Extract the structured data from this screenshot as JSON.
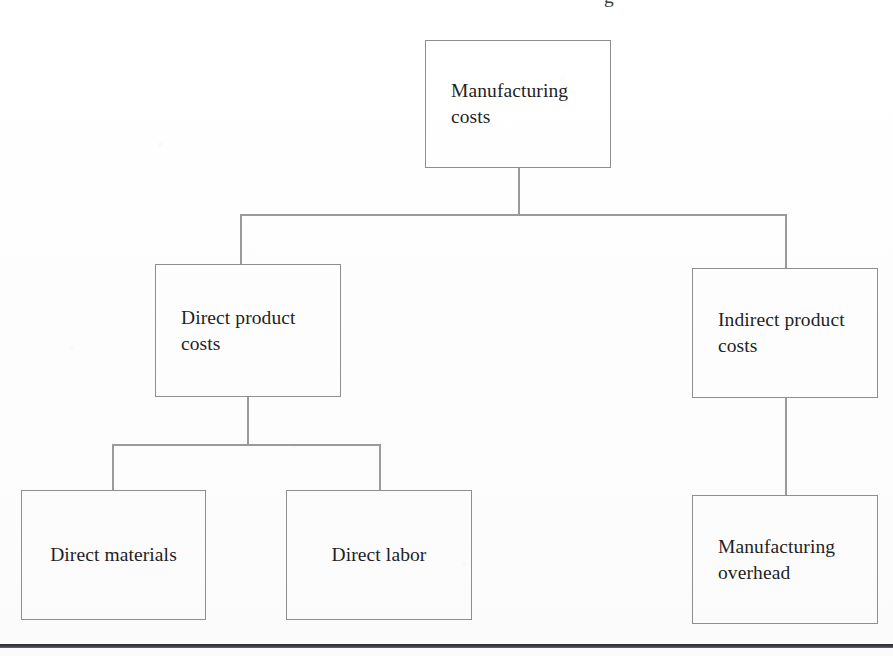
{
  "page": {
    "width": 893,
    "height": 656,
    "background": "#fefefe",
    "ink_color": "#1f1f1f",
    "box_border_color": "#8e8e8e",
    "connector_color": "#9a9a9a",
    "rule_color": "#2e2e33"
  },
  "clipped_header": {
    "text": "g"
  },
  "chart_data": {
    "type": "diagram",
    "subtype": "tree-hierarchy",
    "title": "",
    "orientation": "top-down",
    "levels": 3,
    "nodes": [
      {
        "id": "manufacturing-costs",
        "label": "Manufacturing\ncosts",
        "level": 0,
        "align": "left",
        "x": 425,
        "y": 40,
        "width": 186,
        "height": 128
      },
      {
        "id": "direct-product-costs",
        "label": "Direct product\ncosts",
        "level": 1,
        "align": "left",
        "x": 155,
        "y": 264,
        "width": 186,
        "height": 133
      },
      {
        "id": "indirect-product-costs",
        "label": "Indirect product\ncosts",
        "level": 1,
        "align": "left",
        "x": 692,
        "y": 268,
        "width": 186,
        "height": 130
      },
      {
        "id": "direct-materials",
        "label": "Direct materials",
        "level": 2,
        "align": "center",
        "x": 21,
        "y": 490,
        "width": 185,
        "height": 130
      },
      {
        "id": "direct-labor",
        "label": "Direct labor",
        "level": 2,
        "align": "center",
        "x": 286,
        "y": 490,
        "width": 186,
        "height": 130
      },
      {
        "id": "manufacturing-overhead",
        "label": "Manufacturing\noverhead",
        "level": 2,
        "align": "left",
        "x": 692,
        "y": 495,
        "width": 186,
        "height": 129
      }
    ],
    "edges": [
      {
        "from": "manufacturing-costs",
        "to": "direct-product-costs"
      },
      {
        "from": "manufacturing-costs",
        "to": "indirect-product-costs"
      },
      {
        "from": "direct-product-costs",
        "to": "direct-materials"
      },
      {
        "from": "direct-product-costs",
        "to": "direct-labor"
      },
      {
        "from": "indirect-product-costs",
        "to": "manufacturing-overhead"
      }
    ]
  },
  "connectors": {
    "level0_stem": {
      "x": 518,
      "y": 168,
      "height": 47
    },
    "level0_bar": {
      "x": 240,
      "y": 214,
      "width": 546
    },
    "level0_left_drop": {
      "x": 240,
      "y": 214,
      "height": 50
    },
    "level0_right_drop": {
      "x": 785,
      "y": 214,
      "height": 54
    },
    "level1_stem": {
      "x": 247,
      "y": 397,
      "height": 47
    },
    "level1_bar": {
      "x": 112,
      "y": 444,
      "width": 267
    },
    "level1_left_drop": {
      "x": 112,
      "y": 444,
      "height": 47
    },
    "level1_right_drop": {
      "x": 379,
      "y": 444,
      "height": 47
    },
    "right_stem": {
      "x": 785,
      "y": 398,
      "height": 97
    }
  },
  "bottom_rule": {
    "y": 644,
    "height": 4
  }
}
